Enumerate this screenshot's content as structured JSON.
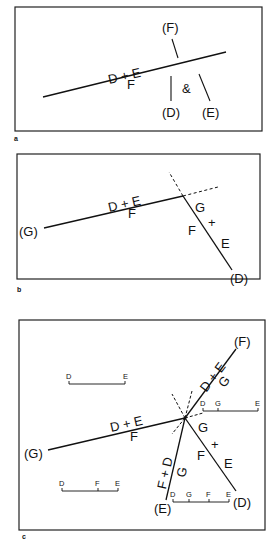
{
  "figure": {
    "panels": [
      {
        "letter": "a",
        "labels": {
          "f_paren": "(F)",
          "d_paren": "(D)",
          "e_paren": "(E)",
          "amp": "&",
          "upper": "D + E",
          "lower": "F"
        }
      },
      {
        "letter": "b",
        "labels": {
          "g_paren": "(G)",
          "d_paren": "(D)",
          "upper": "D + E",
          "lower": "F",
          "g": "G",
          "f": "F",
          "plus": "+",
          "e": "E"
        }
      },
      {
        "letter": "c",
        "labels": {
          "g_paren": "(G)",
          "f_paren": "(F)",
          "d_paren": "(D)",
          "e_paren": "(E)",
          "west_upper": "D + E",
          "west_lower": "F",
          "ne_upper": "D + E",
          "ne_lower": "G",
          "se_g": "G",
          "se_f": "F",
          "se_plus": "+",
          "se_e": "E",
          "sw_upper": "F + D",
          "sw_lower": "G",
          "scale1": [
            "D",
            "E"
          ],
          "scale2": [
            "D",
            "F",
            "E"
          ],
          "scale3": [
            "D",
            "G",
            "E"
          ],
          "scale4": [
            "D",
            "G",
            "F",
            "E"
          ]
        }
      }
    ]
  }
}
